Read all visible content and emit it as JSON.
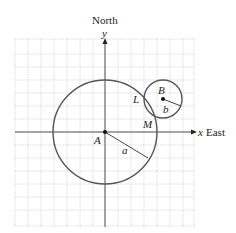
{
  "labels": {
    "north": "North",
    "y_axis": "y",
    "x_axis": "x",
    "east": "East",
    "point_a": "A",
    "point_b": "B",
    "point_l": "L",
    "point_m": "M",
    "radius_a": "a",
    "radius_b": "b"
  },
  "colors": {
    "grid": "#d0d0d0",
    "axis": "#333333",
    "circle": "#555555"
  }
}
